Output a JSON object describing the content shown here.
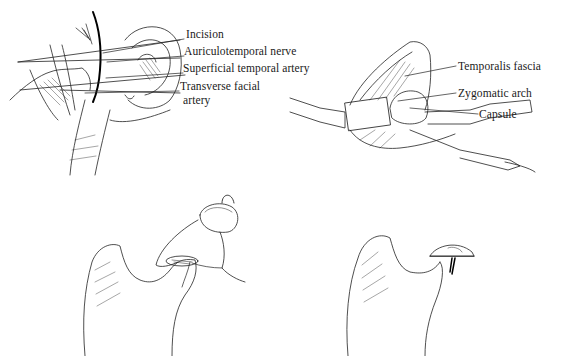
{
  "figures": [
    {
      "id": "panel-a",
      "description": "Preauricular incision exposure with ear and vessels",
      "labels": [
        {
          "text": "Incision",
          "x": 186,
          "y": 34
        },
        {
          "text": "Auriculotemporal nerve",
          "x": 184,
          "y": 51
        },
        {
          "text": "Superficial temporal artery",
          "x": 183,
          "y": 68
        },
        {
          "text": "Transverse facial",
          "x": 180,
          "y": 86
        },
        {
          "text": "artery",
          "x": 180,
          "y": 100
        }
      ]
    },
    {
      "id": "panel-b",
      "description": "Retracted tissue exposing joint capsule",
      "labels": [
        {
          "text": "Temporalis fascia",
          "x": 458,
          "y": 60
        },
        {
          "text": "Zygomatic arch",
          "x": 458,
          "y": 87
        },
        {
          "text": "Capsule",
          "x": 479,
          "y": 109
        }
      ]
    },
    {
      "id": "panel-c",
      "description": "Condyle with drilled hole and suture through disc",
      "labels": []
    },
    {
      "id": "panel-d",
      "description": "Condyle with disc anchored in place",
      "labels": []
    }
  ],
  "colors": {
    "ink": "#1a1a1a",
    "background": "#ffffff"
  }
}
